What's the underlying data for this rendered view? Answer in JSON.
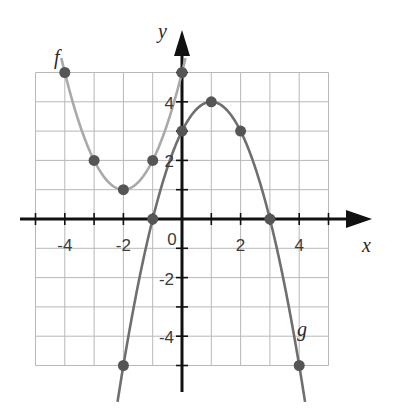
{
  "chart_data": {
    "type": "line",
    "title": "",
    "xlabel": "x",
    "ylabel": "y",
    "xlim": [
      -5,
      5
    ],
    "ylim": [
      -5,
      5
    ],
    "grid": true,
    "x_tick_labels": [
      "-4",
      "-2",
      "0",
      "2",
      "4"
    ],
    "y_tick_labels": [
      "4",
      "2",
      "-2",
      "-4"
    ],
    "origin_label": "0",
    "series": [
      {
        "name": "f",
        "label": "f",
        "color": "#a9a9a9",
        "equation": "f(x) = (x + 2)^2 + 1",
        "points": [
          [
            -4,
            5
          ],
          [
            -3,
            2
          ],
          [
            -2,
            1
          ],
          [
            -1,
            2
          ],
          [
            0,
            5
          ]
        ]
      },
      {
        "name": "g",
        "label": "g",
        "color": "#6f6f6f",
        "equation": "g(x) = -(x - 1)^2 + 4",
        "points": [
          [
            -2,
            -5
          ],
          [
            -1,
            0
          ],
          [
            0,
            3
          ],
          [
            1,
            4
          ],
          [
            2,
            3
          ],
          [
            3,
            0
          ],
          [
            4,
            -5
          ]
        ]
      }
    ]
  },
  "colors": {
    "grid": "#b8b8b8",
    "axis": "#111111",
    "point": "#555555"
  }
}
